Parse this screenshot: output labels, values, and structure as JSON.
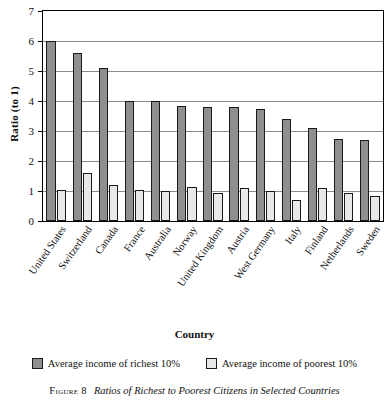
{
  "figure": {
    "number_label": "Figure 8",
    "caption": "Ratios of Richest to Poorest Citizens in Selected Countries"
  },
  "legend": {
    "items": [
      {
        "label": "Average income of richest 10%",
        "key": "rich",
        "color": "#8f8f8f"
      },
      {
        "label": "Average income of poorest 10%",
        "key": "poor",
        "color": "#e8e8e8"
      }
    ]
  },
  "chart_data": {
    "type": "bar",
    "title": "",
    "xlabel": "Country",
    "ylabel": "Ratio (to 1)",
    "ylim": [
      0,
      7
    ],
    "yticks": [
      0,
      1,
      2,
      3,
      4,
      5,
      6,
      7
    ],
    "ytick_labels": [
      "0",
      "1",
      "2",
      "3",
      "4",
      "5",
      "6",
      "7"
    ],
    "grid": true,
    "legend_position": "below-axis",
    "categories": [
      "United States",
      "Switzerland",
      "Canada",
      "France",
      "Australia",
      "Norway",
      "United Kingdom",
      "Austria",
      "West Germany",
      "Italy",
      "Finland",
      "Netherlands",
      "Sweden"
    ],
    "series": [
      {
        "name": "Average income of richest 10%",
        "color": "#8f8f8f",
        "values": [
          6.0,
          5.6,
          5.1,
          4.0,
          4.0,
          3.85,
          3.8,
          3.8,
          3.75,
          3.4,
          3.1,
          2.75,
          2.7
        ]
      },
      {
        "name": "Average income of poorest 10%",
        "color": "#e8e8e8",
        "values": [
          1.05,
          1.6,
          1.2,
          1.05,
          1.0,
          1.15,
          0.95,
          1.1,
          1.0,
          0.7,
          1.1,
          0.95,
          0.85
        ]
      }
    ]
  }
}
